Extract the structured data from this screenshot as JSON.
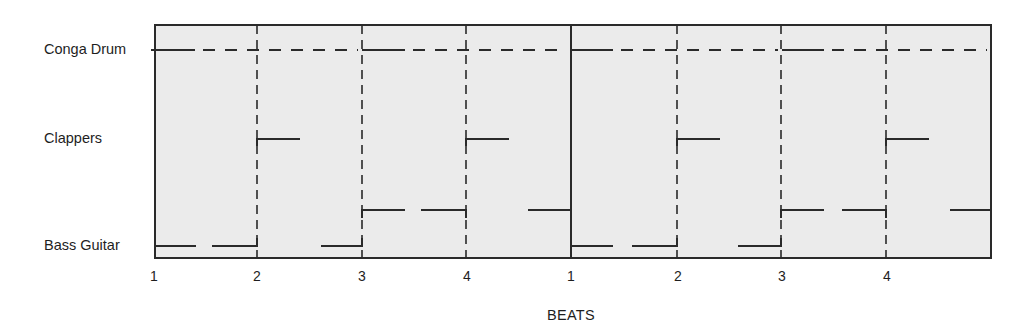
{
  "diagram": {
    "title": "",
    "axis_title": "BEATS",
    "instruments": [
      {
        "name": "Conga Drum",
        "y": 50
      },
      {
        "name": "Clappers",
        "y": 139
      },
      {
        "name": "Bass Guitar",
        "y": 246
      }
    ],
    "beat_labels": [
      "1",
      "2",
      "3",
      "4",
      "1",
      "2",
      "3",
      "4"
    ],
    "frame": {
      "x0": 155,
      "x1": 991,
      "y0": 25,
      "y1": 258
    },
    "beat_x": [
      155,
      257,
      362,
      466,
      571,
      677,
      781,
      886
    ],
    "measure_bar_x": [
      571
    ],
    "colors": {
      "background": "#ebebeb",
      "ink": "#2a2a2a"
    },
    "conga_drum": {
      "y": 50,
      "solid": [
        [
          155,
          195
        ],
        [
          362,
          405
        ],
        [
          572,
          613
        ],
        [
          782,
          824
        ]
      ],
      "dashed_from_to": [
        [
          195,
          362
        ],
        [
          405,
          571
        ],
        [
          613,
          782
        ],
        [
          824,
          991
        ]
      ]
    },
    "clappers": {
      "y": 139,
      "segments": [
        [
          257,
          300
        ],
        [
          466,
          509
        ],
        [
          677,
          720
        ],
        [
          886,
          929
        ]
      ]
    },
    "bass_guitar": {
      "low_y": 246,
      "high_y": 210,
      "low_segments": [
        [
          155,
          196
        ],
        [
          212,
          257
        ],
        [
          321,
          362
        ],
        [
          572,
          613
        ],
        [
          632,
          677
        ],
        [
          738,
          781
        ]
      ],
      "high_segments": [
        [
          362,
          405
        ],
        [
          421,
          466
        ],
        [
          528,
          571
        ],
        [
          782,
          824
        ],
        [
          842,
          886
        ],
        [
          950,
          991
        ]
      ]
    }
  }
}
